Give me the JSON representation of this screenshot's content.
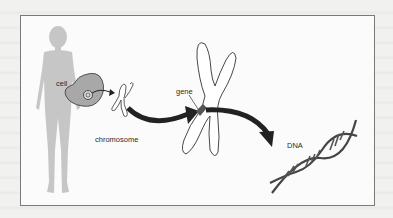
{
  "diagram": {
    "labels": {
      "cell": "cell",
      "chromosome": "chromosome",
      "gene": "gene",
      "dna": "DNA"
    },
    "flow": [
      "human body",
      "cell",
      "chromosome",
      "gene",
      "DNA"
    ],
    "colors": {
      "silhouette": "#c4c4c4",
      "cell_fill": "#a9a9a9",
      "outline": "#333333",
      "arrow": "#2a2a2a",
      "frame_border": "#7a7a7a",
      "background": "#fbfbfb"
    }
  }
}
